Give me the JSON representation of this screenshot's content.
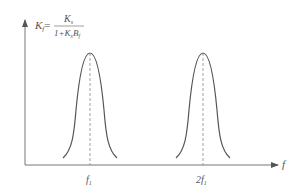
{
  "formula": {
    "lhs": "K",
    "lhs_sub": "f",
    "equals": "=",
    "numerator": "K",
    "numerator_sub": "s",
    "denominator_prefix": "1+K",
    "denominator_sub1": "s",
    "denominator_mid": "B",
    "denominator_sub2": "f"
  },
  "axis": {
    "x_label": "f"
  },
  "ticks": [
    {
      "label": "f",
      "sub": "1"
    },
    {
      "label": "2f",
      "sub": "1"
    }
  ],
  "colors": {
    "line": "#555555",
    "dashed": "#888888"
  }
}
